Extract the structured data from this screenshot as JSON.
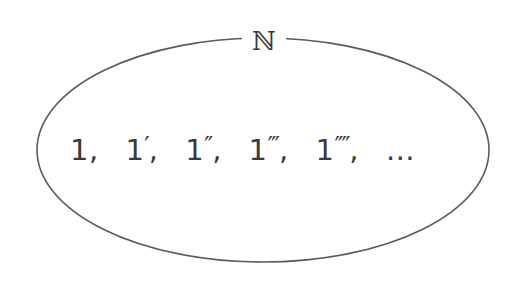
{
  "diagram": {
    "set_label": "ℕ",
    "set_name": "natural-numbers",
    "shape": "ellipse",
    "stroke_color": "#5a5a5a",
    "background_color": "#ffffff",
    "text_color": "#3a3a3a",
    "elements": [
      {
        "base": "1",
        "primes": "",
        "sep": ","
      },
      {
        "base": "1",
        "primes": "′",
        "sep": ","
      },
      {
        "base": "1",
        "primes": "″",
        "sep": ","
      },
      {
        "base": "1",
        "primes": "‴",
        "sep": ","
      },
      {
        "base": "1",
        "primes": "⁗",
        "sep": ","
      },
      {
        "base": "…",
        "primes": "",
        "sep": ""
      }
    ]
  }
}
